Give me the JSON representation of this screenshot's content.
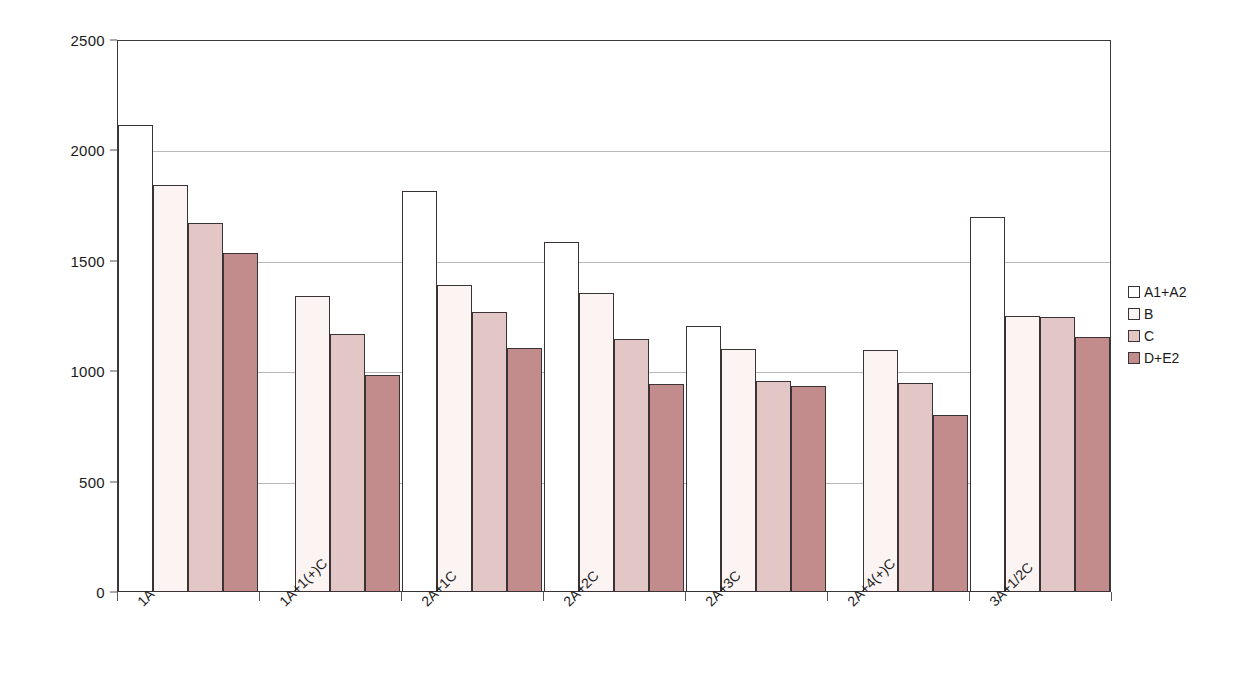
{
  "chart_data": {
    "type": "bar",
    "title": "",
    "xlabel": "",
    "ylabel": "",
    "ylim": [
      0,
      2500
    ],
    "yticks": [
      0,
      500,
      1000,
      1500,
      2000,
      2500
    ],
    "grid": true,
    "legend_position": "right",
    "categories": [
      "1A",
      "1A+1(+)C",
      "2A+1C",
      "2A+2C",
      "2A+3C",
      "2A+4(+)C",
      "3A+1/2C"
    ],
    "series": [
      {
        "name": "A1+A2",
        "color": "#ffffff",
        "values": [
          2115,
          null,
          1815,
          1585,
          1205,
          null,
          1700
        ]
      },
      {
        "name": "B",
        "color": "#fbf4f3",
        "values": [
          1845,
          1340,
          1390,
          1355,
          1100,
          1095,
          1250
        ]
      },
      {
        "name": "C",
        "color": "#e3c6c6",
        "values": [
          1670,
          1170,
          1270,
          1145,
          955,
          945,
          1245
        ]
      },
      {
        "name": "D+E2",
        "color": "#c28c8c",
        "values": [
          1535,
          985,
          1105,
          940,
          935,
          800,
          1155
        ]
      }
    ]
  },
  "legend": {
    "items": [
      {
        "label": "A1+A2",
        "color": "#ffffff"
      },
      {
        "label": "B",
        "color": "#fbf4f3"
      },
      {
        "label": "C",
        "color": "#e3c6c6"
      },
      {
        "label": "D+E2",
        "color": "#c28c8c"
      }
    ]
  },
  "axis": {
    "y_tick_labels": [
      "0",
      "500",
      "1000",
      "1500",
      "2000",
      "2500"
    ]
  }
}
